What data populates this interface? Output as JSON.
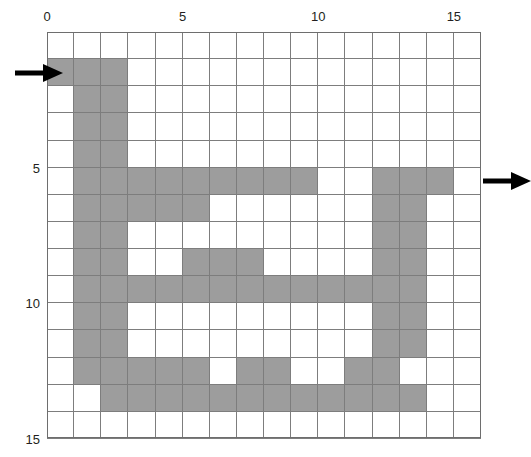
{
  "figure": {
    "type": "grid-maze",
    "grid": {
      "cols": 16,
      "rows": 15,
      "cell_px": 27.125,
      "origin_x_px": 47,
      "origin_y_px": 32,
      "wall_color": "#9d9d9d",
      "open_color": "#ffffff",
      "line_color": "#7d7d7d",
      "border_color": "#6e6e6e"
    },
    "axes": {
      "x_ticks": [
        {
          "value": "0",
          "col": 0
        },
        {
          "value": "5",
          "col": 5
        },
        {
          "value": "10",
          "col": 10
        },
        {
          "value": "15",
          "col": 15
        }
      ],
      "y_ticks": [
        {
          "value": "5",
          "row": 5
        },
        {
          "value": "10",
          "row": 10
        },
        {
          "value": "15",
          "row": 15
        }
      ]
    },
    "arrows": [
      {
        "name": "entry-arrow",
        "side": "left",
        "row": 1,
        "direction": "right",
        "color": "#000000"
      },
      {
        "name": "exit-arrow",
        "side": "right",
        "row": 5,
        "direction": "right",
        "color": "#000000"
      }
    ],
    "cells": [
      [
        0,
        0,
        0,
        0,
        0,
        0,
        0,
        0,
        0,
        0,
        0,
        0,
        0,
        0,
        0,
        0
      ],
      [
        1,
        1,
        1,
        0,
        0,
        0,
        0,
        0,
        0,
        0,
        0,
        0,
        0,
        0,
        0,
        0
      ],
      [
        0,
        1,
        1,
        0,
        0,
        0,
        0,
        0,
        0,
        0,
        0,
        0,
        0,
        0,
        0,
        0
      ],
      [
        0,
        1,
        1,
        0,
        0,
        0,
        0,
        0,
        0,
        0,
        0,
        0,
        0,
        0,
        0,
        0
      ],
      [
        0,
        1,
        1,
        0,
        0,
        0,
        0,
        0,
        0,
        0,
        0,
        0,
        0,
        0,
        0,
        0
      ],
      [
        0,
        1,
        1,
        1,
        1,
        1,
        1,
        1,
        1,
        1,
        0,
        0,
        1,
        1,
        1,
        0
      ],
      [
        0,
        1,
        1,
        1,
        1,
        1,
        0,
        0,
        0,
        0,
        0,
        0,
        1,
        1,
        0,
        0
      ],
      [
        0,
        1,
        1,
        0,
        0,
        0,
        0,
        0,
        0,
        0,
        0,
        0,
        1,
        1,
        0,
        0
      ],
      [
        0,
        1,
        1,
        0,
        0,
        1,
        1,
        1,
        0,
        0,
        0,
        0,
        1,
        1,
        0,
        0
      ],
      [
        0,
        1,
        1,
        1,
        1,
        1,
        1,
        1,
        1,
        1,
        1,
        1,
        1,
        1,
        0,
        0
      ],
      [
        0,
        1,
        1,
        0,
        0,
        0,
        0,
        0,
        0,
        0,
        0,
        0,
        1,
        1,
        0,
        0
      ],
      [
        0,
        1,
        1,
        0,
        0,
        0,
        0,
        0,
        0,
        0,
        0,
        0,
        1,
        1,
        0,
        0
      ],
      [
        0,
        1,
        1,
        1,
        1,
        1,
        0,
        1,
        1,
        0,
        0,
        1,
        1,
        0,
        0,
        0
      ],
      [
        0,
        0,
        1,
        1,
        1,
        1,
        1,
        1,
        1,
        1,
        1,
        1,
        1,
        1,
        0,
        0
      ],
      [
        0,
        0,
        0,
        0,
        0,
        0,
        0,
        0,
        0,
        0,
        0,
        0,
        0,
        0,
        0,
        0
      ]
    ]
  }
}
